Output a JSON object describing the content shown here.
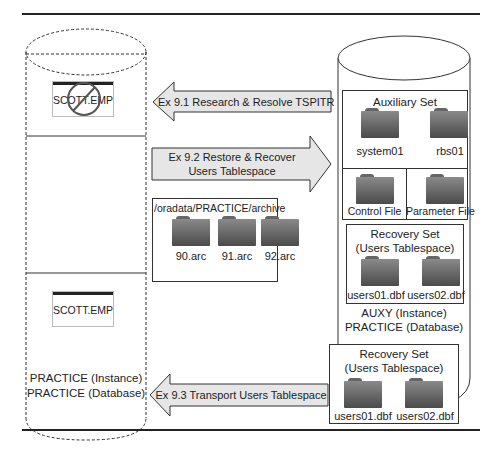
{
  "left_database": {
    "table_top": {
      "label": "SCOTT.EMP",
      "state": "dropped"
    },
    "table_bottom": {
      "label": "SCOTT.EMP",
      "state": "present"
    },
    "instance_label": "PRACTICE (Instance)",
    "database_label": "PRACTICE (Database)"
  },
  "arrows": [
    {
      "label": "Ex 9.1 Research & Resolve TSPITR",
      "direction": "left"
    },
    {
      "label_line1": "Ex 9.2 Restore & Recover",
      "label_line2": "Users Tablespace",
      "direction": "right"
    },
    {
      "label": "Ex 9.3 Transport Users Tablespace",
      "direction": "left"
    }
  ],
  "archive": {
    "path": "/oradata/PRACTICE/archive",
    "files": [
      "90.arc",
      "91.arc",
      "92.arc"
    ]
  },
  "auxiliary_database": {
    "auxiliary_set": {
      "title": "Auxiliary Set",
      "files": [
        "system01",
        "rbs01"
      ]
    },
    "control_file": "Control File",
    "parameter_file": "Parameter File",
    "recovery_set": {
      "title_line1": "Recovery Set",
      "title_line2": "(Users Tablespace)",
      "files": [
        "users01.dbf",
        "users02.dbf"
      ]
    },
    "instance_label": "AUXY (Instance)",
    "database_label": "PRACTICE (Database)"
  },
  "transport_set": {
    "title_line1": "Recovery Set",
    "title_line2": "(Users Tablespace)",
    "files": [
      "users01.dbf",
      "users02.dbf"
    ]
  },
  "colors": {
    "arrow_fill": "#e6e6e6",
    "stroke": "#333333",
    "folder": "#6a6a6a"
  }
}
